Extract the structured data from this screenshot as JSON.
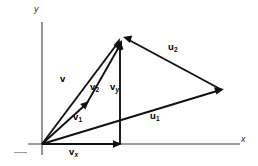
{
  "figure": {
    "background_color": "#ffffff",
    "ink_color": "#111111",
    "axis_color": "#3c3c3c"
  },
  "axes": {
    "y_label": "y",
    "x_label": "x",
    "origin": {
      "x": 42,
      "y": 144
    },
    "y_axis": {
      "x1": 42,
      "y1": 22,
      "x2": 42,
      "y2": 155
    },
    "x_axis": {
      "x1": 28,
      "y1": 144,
      "x2": 240,
      "y2": 144
    }
  },
  "vectors": [
    {
      "name": "v",
      "label": "v",
      "subscript": "",
      "description": "resultant vector from origin to apex",
      "from": {
        "x": 42,
        "y": 144
      },
      "to": {
        "x": 120,
        "y": 38
      },
      "label_pos": {
        "x": 60,
        "y": 75
      }
    },
    {
      "name": "v2",
      "label": "v",
      "subscript": "2",
      "description": "second component vector from v1 tip to apex",
      "from": {
        "x": 87,
        "y": 103
      },
      "to": {
        "x": 122,
        "y": 40
      },
      "label_pos": {
        "x": 91,
        "y": 83
      }
    },
    {
      "name": "vy",
      "label": "v",
      "subscript": "y",
      "description": "vertical y-component of v",
      "from": {
        "x": 120,
        "y": 144
      },
      "to": {
        "x": 120,
        "y": 40
      },
      "label_pos": {
        "x": 111,
        "y": 83
      }
    },
    {
      "name": "v1",
      "label": "v",
      "subscript": "1",
      "description": "first component vector from origin",
      "from": {
        "x": 42,
        "y": 144
      },
      "to": {
        "x": 89,
        "y": 101
      },
      "label_pos": {
        "x": 74,
        "y": 113
      }
    },
    {
      "name": "vx",
      "label": "v",
      "subscript": "x",
      "description": "horizontal x-component of v along the x-axis",
      "from": {
        "x": 42,
        "y": 144
      },
      "to": {
        "x": 122,
        "y": 144
      },
      "label_pos": {
        "x": 70,
        "y": 148
      }
    },
    {
      "name": "u1",
      "label": "u",
      "subscript": "1",
      "description": "first vector of the u-pair from origin to right vertex",
      "from": {
        "x": 42,
        "y": 144
      },
      "to": {
        "x": 224,
        "y": 89
      },
      "label_pos": {
        "x": 151,
        "y": 112
      }
    },
    {
      "name": "u2",
      "label": "u",
      "subscript": "2",
      "description": "second vector of the u-pair from right vertex to apex",
      "from": {
        "x": 222,
        "y": 90
      },
      "to": {
        "x": 123,
        "y": 37
      },
      "label_pos": {
        "x": 169,
        "y": 43
      }
    }
  ],
  "points": {
    "origin": {
      "x": 42,
      "y": 144
    },
    "apex": {
      "x": 120,
      "y": 38
    },
    "right_vertex": {
      "x": 222,
      "y": 90
    },
    "v1_tip": {
      "x": 87,
      "y": 103
    },
    "vx_tip": {
      "x": 120,
      "y": 144
    }
  }
}
